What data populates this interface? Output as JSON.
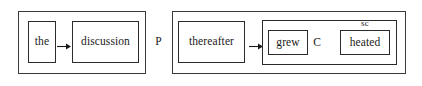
{
  "diagram": {
    "type": "nested-box-syntax-diagram",
    "width": 422,
    "height": 86,
    "background_color": "#ffffff",
    "line_color": "#2b2b2b",
    "text_color": "#1a1a1a"
  },
  "clauses": [
    {
      "id": "clause-left",
      "nodes": [
        {
          "id": "box-the",
          "label": "the"
        },
        {
          "id": "box-discussion",
          "label": "discussion"
        }
      ],
      "arrows": [
        {
          "id": "arrow-left",
          "direction": "right",
          "from": "box-the",
          "to": "box-discussion"
        }
      ]
    },
    {
      "id": "clause-right",
      "nodes": [
        {
          "id": "box-thereafter",
          "label": "thereafter"
        },
        {
          "id": "box-grew",
          "label": "grew"
        },
        {
          "id": "box-heated",
          "label": "heated"
        }
      ],
      "arrows": [
        {
          "id": "arrow-right",
          "direction": "right",
          "from": "box-thereafter",
          "to": "box-c-group"
        }
      ]
    }
  ],
  "tags": {
    "p": "P",
    "c": "C",
    "sc": "sc"
  },
  "icons": {
    "arrow_right": "arrow-right-icon"
  }
}
